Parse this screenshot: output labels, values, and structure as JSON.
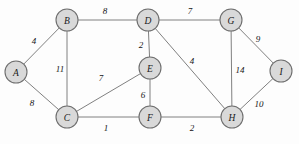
{
  "figure": {
    "type": "weighted-undirected-graph",
    "background_color": "#fdfdfd",
    "node_fill_color": "#d9d9d9",
    "node_stroke_color": "#6e6e6e",
    "edge_color": "#808080",
    "label_color": "#141414",
    "node_radius": 11
  },
  "nodes": [
    {
      "id": "A",
      "label": "A",
      "x": 16,
      "y": 72
    },
    {
      "id": "B",
      "label": "B",
      "x": 67,
      "y": 20
    },
    {
      "id": "C",
      "label": "C",
      "x": 67,
      "y": 117
    },
    {
      "id": "D",
      "label": "D",
      "x": 148,
      "y": 20
    },
    {
      "id": "E",
      "label": "E",
      "x": 150,
      "y": 68
    },
    {
      "id": "F",
      "label": "F",
      "x": 150,
      "y": 117
    },
    {
      "id": "G",
      "label": "G",
      "x": 231,
      "y": 20
    },
    {
      "id": "H",
      "label": "H",
      "x": 232,
      "y": 117
    },
    {
      "id": "I",
      "label": "I",
      "x": 281,
      "y": 71
    }
  ],
  "edges": [
    {
      "id": "A-B",
      "source": "A",
      "target": "B",
      "weight": "4",
      "label_x": 34,
      "label_y": 41
    },
    {
      "id": "A-C",
      "source": "A",
      "target": "C",
      "weight": "8",
      "label_x": 32,
      "label_y": 103
    },
    {
      "id": "B-C",
      "source": "B",
      "target": "C",
      "weight": "11",
      "label_x": 60,
      "label_y": 69
    },
    {
      "id": "B-D",
      "source": "B",
      "target": "D",
      "weight": "8",
      "label_x": 105,
      "label_y": 11
    },
    {
      "id": "C-E",
      "source": "C",
      "target": "E",
      "weight": "7",
      "label_x": 101,
      "label_y": 78
    },
    {
      "id": "C-F",
      "source": "C",
      "target": "F",
      "weight": "1",
      "label_x": 106,
      "label_y": 128
    },
    {
      "id": "D-E",
      "source": "D",
      "target": "E",
      "weight": "2",
      "label_x": 141,
      "label_y": 45
    },
    {
      "id": "D-G",
      "source": "D",
      "target": "G",
      "weight": "7",
      "label_x": 190,
      "label_y": 11
    },
    {
      "id": "D-H",
      "source": "D",
      "target": "H",
      "weight": "4",
      "label_x": 192,
      "label_y": 61
    },
    {
      "id": "E-F",
      "source": "E",
      "target": "F",
      "weight": "6",
      "label_x": 143,
      "label_y": 95
    },
    {
      "id": "F-H",
      "source": "F",
      "target": "H",
      "weight": "2",
      "label_x": 192,
      "label_y": 128
    },
    {
      "id": "G-H",
      "source": "G",
      "target": "H",
      "weight": "14",
      "label_x": 240,
      "label_y": 70
    },
    {
      "id": "G-I",
      "source": "G",
      "target": "I",
      "weight": "9",
      "label_x": 258,
      "label_y": 39
    },
    {
      "id": "H-I",
      "source": "H",
      "target": "I",
      "weight": "10",
      "label_x": 259,
      "label_y": 104
    }
  ]
}
